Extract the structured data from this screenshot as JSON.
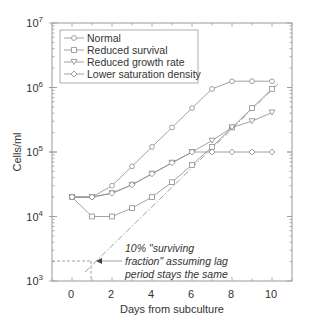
{
  "chart_data": {
    "type": "line",
    "title": "",
    "xlabel": "Days from subculture",
    "ylabel": "Cells/ml",
    "yscale": "log",
    "xlim": [
      -1,
      11
    ],
    "ylim": [
      1000,
      10000000
    ],
    "xticks": [
      0,
      2,
      4,
      6,
      8,
      10
    ],
    "xtick_labels": [
      "0",
      "2",
      "4",
      "6",
      "8",
      "10"
    ],
    "yticks": [
      1000,
      10000,
      100000,
      1000000,
      10000000
    ],
    "ytick_labels": [
      {
        "base": "10",
        "exp": "3"
      },
      {
        "base": "10",
        "exp": "4"
      },
      {
        "base": "10",
        "exp": "5"
      },
      {
        "base": "10",
        "exp": "6"
      },
      {
        "base": "10",
        "exp": "7"
      }
    ],
    "grid": false,
    "legend_position": "upper left",
    "x": [
      0,
      1,
      2,
      3,
      4,
      5,
      6,
      7,
      8,
      9,
      10
    ],
    "series": [
      {
        "name": "Normal",
        "marker": "circle",
        "values": [
          20000,
          20000,
          30000,
          60000,
          120000,
          240000,
          480000,
          950000,
          1250000,
          1250000,
          1250000
        ]
      },
      {
        "name": "Reduced survival",
        "marker": "square",
        "values": [
          20000,
          10000,
          10000,
          13500,
          20000,
          34000,
          63000,
          120000,
          240000,
          480000,
          950000
        ]
      },
      {
        "name": "Reduced growth rate",
        "marker": "triangle-down",
        "values": [
          20000,
          20000,
          23000,
          31000,
          46000,
          68000,
          100000,
          150000,
          240000,
          300000,
          410000
        ]
      },
      {
        "name": "Lower saturation density",
        "marker": "diamond",
        "values": [
          20000,
          20000,
          23000,
          31000,
          46000,
          68000,
          100000,
          100000,
          100000,
          100000,
          100000
        ]
      }
    ],
    "annotations": [
      {
        "text_lines": [
          "10% \"surviving",
          "fraction\" assuming lag",
          "period stays the same"
        ],
        "points_to": {
          "x": 1,
          "y": 2000
        }
      },
      {
        "type": "dash-dot-line",
        "from": {
          "x": 0.7,
          "y": 1300
        },
        "to": {
          "x": 10.3,
          "y": 1100000
        }
      }
    ]
  },
  "legend": {
    "items": [
      {
        "label": "Normal"
      },
      {
        "label": "Reduced survival"
      },
      {
        "label": "Reduced growth rate"
      },
      {
        "label": "Lower saturation density"
      }
    ]
  },
  "axes": {
    "xlabel": "Days from subculture",
    "ylabel": "Cells/ml",
    "x_ticks": [
      "0",
      "2",
      "4",
      "6",
      "8",
      "10"
    ],
    "y_ticks": [
      {
        "base": "10",
        "exp": "7"
      },
      {
        "base": "10",
        "exp": "6"
      },
      {
        "base": "10",
        "exp": "5"
      },
      {
        "base": "10",
        "exp": "4"
      },
      {
        "base": "10",
        "exp": "3"
      }
    ]
  },
  "annotation": {
    "line1": "10% \"surviving",
    "line2": "fraction\" assuming lag",
    "line3": "period stays the same"
  },
  "colors": {
    "line": "#8a8a8a",
    "frame": "#9a9a9a",
    "text": "#333333"
  }
}
